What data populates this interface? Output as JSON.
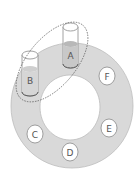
{
  "diagram": {
    "positions": [
      {
        "id": "A",
        "label": "A",
        "type": "cylinder"
      },
      {
        "id": "B",
        "label": "B",
        "type": "cylinder"
      },
      {
        "id": "C",
        "label": "C",
        "type": "slot"
      },
      {
        "id": "D",
        "label": "D",
        "type": "slot"
      },
      {
        "id": "E",
        "label": "E",
        "type": "slot"
      },
      {
        "id": "F",
        "label": "F",
        "type": "slot"
      }
    ],
    "colors": {
      "ring": "#d9d9d9",
      "outline": "#8a8a8a",
      "liquid": "#c8c8c8",
      "slot_fill": "#ffffff"
    }
  }
}
